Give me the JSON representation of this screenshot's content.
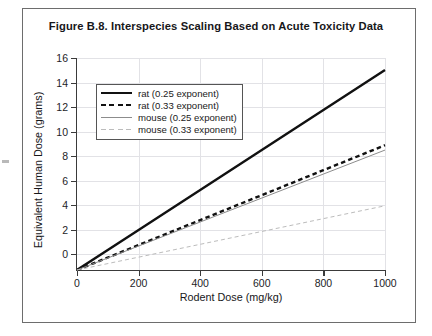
{
  "figure": {
    "title": "Figure B.8.  Interspecies Scaling Based on Acute Toxicity Data"
  },
  "chart_data": {
    "type": "line",
    "title": "Figure B.8.  Interspecies Scaling Based on Acute Toxicity Data",
    "xlabel": "Rodent Dose (mg/kg)",
    "ylabel": "Equivalent Human Dose (grams)",
    "xlim": [
      0,
      1000
    ],
    "ylim": [
      0,
      17.5
    ],
    "xticks": [
      0,
      200,
      400,
      600,
      800,
      1000
    ],
    "yticks": [
      0,
      2,
      4,
      6,
      8,
      10,
      12,
      14,
      16
    ],
    "xtick_labels": [
      "0",
      "200",
      "400",
      "600",
      "800",
      "1000"
    ],
    "ytick_labels": [
      "0",
      "2",
      "4",
      "6",
      "8",
      "10",
      "12",
      "14",
      "16"
    ],
    "grid": true,
    "legend_position": "upper left",
    "x": [
      0,
      200,
      400,
      600,
      800,
      1000
    ],
    "series": [
      {
        "name": "rat (0.25 exponent)",
        "values": [
          0,
          3.3,
          6.6,
          9.9,
          13.2,
          16.5
        ],
        "color": "#111111",
        "style": "solid",
        "width": 2.4
      },
      {
        "name": "rat (0.33 exponent)",
        "values": [
          0,
          2.06,
          4.12,
          6.18,
          8.24,
          10.3
        ],
        "color": "#111111",
        "style": "dashed",
        "width": 2.4
      },
      {
        "name": "mouse (0.25 exponent)",
        "values": [
          0,
          1.98,
          3.96,
          5.94,
          7.92,
          9.9
        ],
        "color": "#8c8c8c",
        "style": "solid",
        "width": 1.0
      },
      {
        "name": "mouse (0.33 exponent)",
        "values": [
          0,
          1.06,
          2.12,
          3.18,
          4.24,
          5.3
        ],
        "color": "#bcbcbc",
        "style": "dashed",
        "width": 1.0
      }
    ]
  },
  "legend": {
    "items": [
      {
        "label": "rat (0.25 exponent)"
      },
      {
        "label": "rat (0.33 exponent)"
      },
      {
        "label": "mouse (0.25 exponent)"
      },
      {
        "label": "mouse (0.33 exponent)"
      }
    ]
  }
}
